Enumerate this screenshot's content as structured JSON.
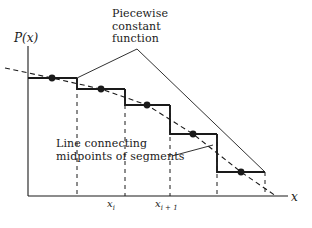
{
  "figure": {
    "background": "#ffffff",
    "ink": "#1a1a1a",
    "annotations": {
      "piecewise": "Piecewise\nconstant\nfunction",
      "midpoints": "Line connecting\nmidpoints of segments"
    },
    "axes": {
      "y_label": "P(x)",
      "x_label": "x",
      "x_ticks": [
        {
          "label_base": "x",
          "label_sub": "i",
          "x": 115
        },
        {
          "label_base": "x",
          "label_sub": "i + 1",
          "x": 165
        }
      ]
    }
  },
  "chart_data": {
    "type": "line",
    "xlabel": "x",
    "ylabel": "P(x)",
    "grid": false,
    "legend": "none",
    "axis_pixel_frame": {
      "x_axis_y": 196,
      "y_axis_x": 28,
      "x_axis_end": 288,
      "y_axis_top": 46
    },
    "series": [
      {
        "name": "Piecewise constant function",
        "style": "solid-step",
        "color": "#1a1a1a",
        "steps": [
          {
            "index": 1,
            "x_start": 28,
            "x_end": 77,
            "y": 78
          },
          {
            "index": 2,
            "x_start": 77,
            "x_end": 125,
            "y": 89
          },
          {
            "index": 3,
            "x_start": 125,
            "x_end": 170,
            "y": 105
          },
          {
            "index": 4,
            "x_start": 170,
            "x_end": 217,
            "y": 134
          },
          {
            "index": 5,
            "x_start": 217,
            "x_end": 265,
            "y": 172
          }
        ],
        "boundaries_dashed_x": [
          77,
          125,
          170,
          217,
          265
        ]
      },
      {
        "name": "Line connecting midpoints of segments",
        "style": "dashed",
        "color": "#1a1a1a",
        "points": [
          {
            "x": 5,
            "y": 68
          },
          {
            "x": 52,
            "y": 78
          },
          {
            "x": 101,
            "y": 89
          },
          {
            "x": 147,
            "y": 105
          },
          {
            "x": 193,
            "y": 134
          },
          {
            "x": 241,
            "y": 172
          },
          {
            "x": 276,
            "y": 196
          }
        ]
      }
    ],
    "midpoint_markers": [
      {
        "x": 52,
        "y": 78
      },
      {
        "x": 101,
        "y": 89
      },
      {
        "x": 147,
        "y": 105
      },
      {
        "x": 193,
        "y": 134
      },
      {
        "x": 241,
        "y": 172
      }
    ],
    "leader_lines": [
      {
        "name": "piecewise-leader",
        "points": [
          [
            77,
            78
          ],
          [
            137,
            49
          ],
          [
            265,
            172
          ]
        ]
      },
      {
        "name": "midpoints-leader",
        "points": [
          [
            172,
            156
          ],
          [
            213,
            145
          ]
        ]
      }
    ]
  }
}
